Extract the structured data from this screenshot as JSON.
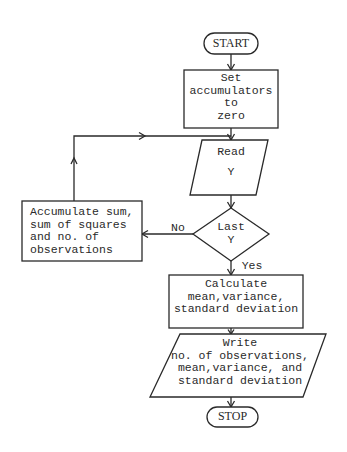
{
  "diagram": {
    "type": "flowchart",
    "colors": {
      "stroke": "#2a2a2a",
      "background": "#ffffff"
    },
    "nodes": {
      "start": {
        "shape": "terminal",
        "label": "START"
      },
      "init": {
        "shape": "process",
        "lines": [
          "Set",
          "accumulators",
          "to",
          "zero"
        ]
      },
      "read": {
        "shape": "input-output",
        "lines": [
          "Read",
          "Y"
        ]
      },
      "decision": {
        "shape": "decision",
        "lines": [
          "Last",
          "Y"
        ]
      },
      "accumulate": {
        "shape": "process",
        "lines": [
          "Accumulate sum,",
          "sum of squares",
          "and no. of",
          "observations"
        ]
      },
      "calculate": {
        "shape": "process",
        "lines": [
          "Calculate",
          "mean,variance,",
          "standard deviation"
        ]
      },
      "write": {
        "shape": "input-output",
        "lines": [
          "Write",
          "no. of observations,",
          "mean,variance, and",
          "standard deviation"
        ]
      },
      "stop": {
        "shape": "terminal",
        "label": "STOP"
      }
    },
    "edges": [
      {
        "from": "start",
        "to": "init"
      },
      {
        "from": "init",
        "to": "read"
      },
      {
        "from": "read",
        "to": "decision"
      },
      {
        "from": "decision",
        "to": "accumulate",
        "label": "No"
      },
      {
        "from": "accumulate",
        "to": "read",
        "label": ""
      },
      {
        "from": "decision",
        "to": "calculate",
        "label": "Yes"
      },
      {
        "from": "calculate",
        "to": "write"
      },
      {
        "from": "write",
        "to": "stop"
      }
    ],
    "edge_labels": {
      "no": "No",
      "yes": "Yes"
    }
  }
}
